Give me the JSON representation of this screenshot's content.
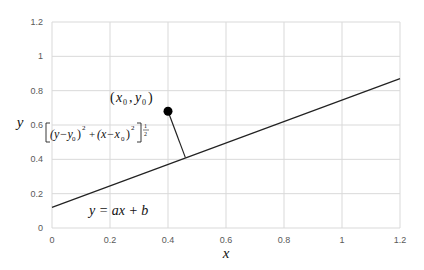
{
  "chart_data": {
    "type": "line",
    "title": "",
    "xlabel": "x",
    "ylabel": "y",
    "xlim": [
      0,
      1.2
    ],
    "ylim": [
      0,
      1.2
    ],
    "grid": true,
    "legend": "none",
    "x_ticks": [
      "0",
      "0.2",
      "0.4",
      "0.6",
      "0.8",
      "1",
      "1.2"
    ],
    "y_ticks": [
      "0",
      "0.2",
      "0.4",
      "0.6",
      "0.8",
      "1",
      "1.2"
    ],
    "series": [
      {
        "name": "y = ax + b",
        "type": "line",
        "x": [
          0,
          1.2
        ],
        "y": [
          0.12,
          0.87
        ]
      },
      {
        "name": "(x0, y0)",
        "type": "scatter",
        "x": [
          0.4
        ],
        "y": [
          0.68
        ]
      },
      {
        "name": "distance",
        "type": "line",
        "x": [
          0.4,
          0.46
        ],
        "y": [
          0.68,
          0.41
        ]
      }
    ],
    "annotations": [
      {
        "text": "(x0, y0)",
        "x": 0.28,
        "y": 0.75
      },
      {
        "text": "[(y−y0)^2 + (x−x0)^2]^(1/2)",
        "x": 0.05,
        "y": 0.5
      },
      {
        "text": "y = ax + b",
        "x": 0.12,
        "y": 0.1
      }
    ]
  },
  "labels": {
    "xlabel": "x",
    "ylabel": "y",
    "point_label_open": "(",
    "point_x": "x",
    "point_x_sub": "0",
    "point_comma": ",",
    "point_y": "y",
    "point_y_sub": "0",
    "point_label_close": ")",
    "line_eq": "y = ax + b",
    "dist_part1": "(y−y",
    "dist_sub1": "0",
    "dist_part2": ")",
    "dist_sq1": "2",
    "dist_plus": "+",
    "dist_part3": "(x−x",
    "dist_sub2": "0",
    "dist_part4": ")",
    "dist_sq2": "2",
    "dist_exp_num": "1",
    "dist_exp_den": "2"
  }
}
